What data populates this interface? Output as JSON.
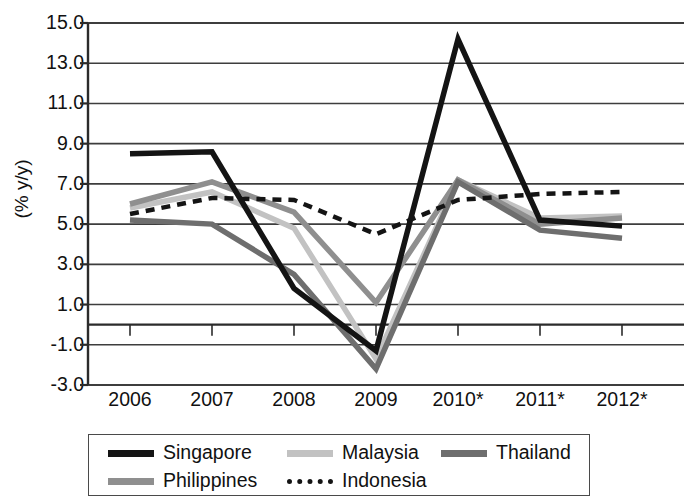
{
  "chart_data": {
    "type": "line",
    "title": "",
    "subtitle": "",
    "xlabel": "",
    "ylabel": "(% y/y)",
    "categories": [
      "2006",
      "2007",
      "2008",
      "2009",
      "2010*",
      "2011*",
      "2012*"
    ],
    "x_tick_labels": [
      "2006",
      "2007",
      "2008",
      "2009",
      "2010*",
      "2011*",
      "2012*"
    ],
    "y_tick_labels": [
      "15.0",
      "13.0",
      "11.0",
      "9.0",
      "7.0",
      "5.0",
      "3.0",
      "1.0",
      "-1.0",
      "-3.0"
    ],
    "y_tick_values": [
      15.0,
      13.0,
      11.0,
      9.0,
      7.0,
      5.0,
      3.0,
      1.0,
      -1.0,
      -3.0
    ],
    "ylim": [
      -3.0,
      15.0
    ],
    "grid": "horizontal",
    "zero_line": true,
    "legend_position": "bottom",
    "legend_columns": 3,
    "series": [
      {
        "name": "Singapore",
        "color": "#141414",
        "style": "solid",
        "width": 5.5,
        "values": [
          8.5,
          8.6,
          1.8,
          -1.3,
          14.2,
          5.2,
          4.9
        ]
      },
      {
        "name": "Philippines",
        "color": "#8f8f8f",
        "style": "solid",
        "width": 5.5,
        "values": [
          6.0,
          7.1,
          5.6,
          1.1,
          7.2,
          5.0,
          5.3
        ]
      },
      {
        "name": "Malaysia",
        "color": "#c2c2c2",
        "style": "solid",
        "width": 5.5,
        "values": [
          5.8,
          6.6,
          4.8,
          -1.7,
          7.2,
          5.3,
          5.4
        ]
      },
      {
        "name": "Indonesia",
        "color": "#141414",
        "style": "dashed",
        "width": 4.5,
        "values": [
          5.5,
          6.3,
          6.2,
          4.5,
          6.2,
          6.5,
          6.6
        ]
      },
      {
        "name": "Thailand",
        "color": "#6e6e6e",
        "style": "solid",
        "width": 5.5,
        "values": [
          5.2,
          5.0,
          2.5,
          -2.2,
          7.1,
          4.7,
          4.3
        ]
      }
    ],
    "legend_entries": [
      {
        "label": "Singapore",
        "color": "#141414",
        "style": "solid",
        "row": 0,
        "col": 0
      },
      {
        "label": "Malaysia",
        "color": "#c2c2c2",
        "style": "solid",
        "row": 0,
        "col": 1
      },
      {
        "label": "Thailand",
        "color": "#6e6e6e",
        "style": "solid",
        "row": 0,
        "col": 2
      },
      {
        "label": "Philippines",
        "color": "#8f8f8f",
        "style": "solid",
        "row": 1,
        "col": 0
      },
      {
        "label": "Indonesia",
        "color": "#141414",
        "style": "dashed",
        "row": 1,
        "col": 1
      }
    ]
  }
}
